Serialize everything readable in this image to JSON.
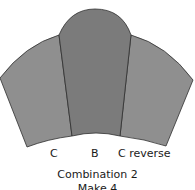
{
  "diagram": {
    "pieces": [
      {
        "id": "C",
        "label": "C",
        "fill": "#8f8f8f"
      },
      {
        "id": "B",
        "label": "B",
        "fill": "#7b7b7b"
      },
      {
        "id": "C-reverse",
        "label": "C reverse",
        "fill": "#8f8f8f"
      }
    ],
    "outline_color": "#2e2e2e",
    "caption_line1": "Combination 2",
    "caption_line2": "Make 4"
  }
}
